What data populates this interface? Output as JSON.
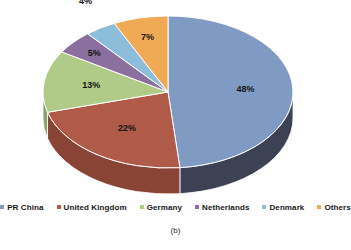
{
  "chart_data": {
    "type": "pie",
    "title": "",
    "caption": "(b)",
    "legend_position": "bottom",
    "three_d": true,
    "start_angle_deg": 0,
    "direction": "clockwise",
    "categories": [
      "PR China",
      "United Kingdom",
      "Germany",
      "Netherlands",
      "Denmark",
      "Others"
    ],
    "values": [
      48,
      22,
      13,
      5,
      4,
      7
    ],
    "value_labels": [
      "48%",
      "22%",
      "13%",
      "5%",
      "4%",
      "7%"
    ],
    "colors": [
      "#7f9bc4",
      "#b05a4a",
      "#b0cb88",
      "#8b6f9e",
      "#8cbdd9",
      "#f0a955"
    ],
    "side_colors": [
      "#3c4154",
      "#8a4436",
      "#8aa368",
      "#6c5479",
      "#6c94ab",
      "#c2823d"
    ],
    "slices": [
      {
        "label": "PR China",
        "value": 48,
        "display": "48%",
        "color": "#7f9bc4",
        "side_color": "#3c4154"
      },
      {
        "label": "United Kingdom",
        "value": 22,
        "display": "22%",
        "color": "#b05a4a",
        "side_color": "#8a4436"
      },
      {
        "label": "Germany",
        "value": 13,
        "display": "13%",
        "color": "#b0cb88",
        "side_color": "#8aa368"
      },
      {
        "label": "Netherlands",
        "value": 5,
        "display": "5%",
        "color": "#8b6f9e",
        "side_color": "#6c5479"
      },
      {
        "label": "Denmark",
        "value": 4,
        "display": "4%",
        "color": "#8cbdd9",
        "side_color": "#6c94ab"
      },
      {
        "label": "Others",
        "value": 7,
        "display": "7%",
        "color": "#f0a955",
        "side_color": "#c2823d"
      }
    ]
  },
  "legend": {
    "items": [
      {
        "label": "PR China",
        "color": "#7f9bc4"
      },
      {
        "label": "United Kingdom",
        "color": "#b05a4a"
      },
      {
        "label": "Germany",
        "color": "#b0cb88"
      },
      {
        "label": "Netherlands",
        "color": "#8b6f9e"
      },
      {
        "label": "Denmark",
        "color": "#8cbdd9"
      },
      {
        "label": "Others",
        "color": "#f0a955"
      }
    ]
  },
  "caption": {
    "text": "(b)"
  }
}
